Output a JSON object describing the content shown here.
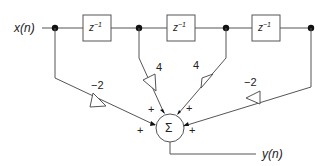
{
  "diagram": {
    "type": "FIR filter direct-form block diagram",
    "input_label": "x(n)",
    "output_label": "y(n)",
    "delays": [
      {
        "label": "z",
        "exp": "−1"
      },
      {
        "label": "z",
        "exp": "−1"
      },
      {
        "label": "z",
        "exp": "−1"
      }
    ],
    "gains": [
      {
        "tap": 0,
        "label": "−2"
      },
      {
        "tap": 1,
        "label": "4"
      },
      {
        "tap": 2,
        "label": "4"
      },
      {
        "tap": 3,
        "label": "−2"
      }
    ],
    "summer": {
      "symbol": "Σ",
      "input_signs": [
        "+",
        "+",
        "+",
        "+"
      ]
    },
    "colors": {
      "line": "#555555",
      "node": "#111111",
      "text": "#222222",
      "background": "#ffffff"
    }
  }
}
